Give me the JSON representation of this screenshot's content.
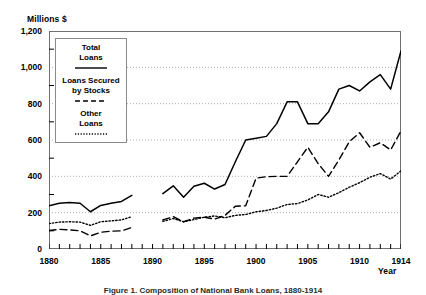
{
  "chart_data": {
    "type": "line",
    "title": "",
    "caption": "Figure 1. Composition of National Bank Loans, 1880-1914",
    "ylabel": "Millions $",
    "xlabel": "Year",
    "ylim": [
      0,
      1200
    ],
    "xlim": [
      1880,
      1914
    ],
    "yticks": [
      0,
      200,
      400,
      600,
      800,
      1000,
      1200
    ],
    "ytick_labels": [
      "0",
      "200",
      "400",
      "600",
      "800",
      "1,000",
      "1,200"
    ],
    "xticks": [
      1880,
      1885,
      1890,
      1895,
      1900,
      1905,
      1910,
      1914
    ],
    "xtick_labels": [
      "1880",
      "1885",
      "1890",
      "1895",
      "1900",
      "1905",
      "1910",
      "1914"
    ],
    "x_minor_tick_step": 1,
    "grid": "horizontal-dotted",
    "legend_position": "upper-left-inside",
    "series": [
      {
        "name": "Total Loans",
        "legend_label_lines": [
          "Total",
          "Loans"
        ],
        "style": "solid",
        "color": "#000000",
        "segments": [
          {
            "x": [
              1880,
              1881,
              1882,
              1883,
              1884,
              1885,
              1886,
              1887,
              1888
            ],
            "values": [
              238,
              252,
              256,
              252,
              205,
              240,
              252,
              262,
              295
            ]
          },
          {
            "x": [
              1891,
              1892,
              1893,
              1894,
              1895,
              1896,
              1897,
              1898,
              1899,
              1900,
              1901,
              1902,
              1903,
              1904,
              1905,
              1906,
              1907,
              1908,
              1909,
              1910,
              1911,
              1912,
              1913,
              1914
            ],
            "values": [
              305,
              348,
              285,
              345,
              362,
              330,
              355,
              480,
              600,
              610,
              620,
              690,
              810,
              810,
              690,
              690,
              755,
              880,
              900,
              870,
              920,
              960,
              880,
              1090
            ]
          }
        ]
      },
      {
        "name": "Loans Secured by Stocks",
        "legend_label_lines": [
          "Loans Secured",
          "by Stocks"
        ],
        "style": "dashed",
        "color": "#000000",
        "segments": [
          {
            "x": [
              1880,
              1881,
              1882,
              1883,
              1884,
              1885,
              1886,
              1887,
              1888
            ],
            "values": [
              102,
              108,
              105,
              100,
              72,
              92,
              98,
              100,
              118
            ]
          },
          {
            "x": [
              1891,
              1892,
              1893,
              1894,
              1895,
              1896,
              1897,
              1898,
              1899,
              1900,
              1901,
              1902,
              1903,
              1904,
              1905,
              1906,
              1907,
              1908,
              1909,
              1910,
              1911,
              1912,
              1913,
              1914
            ],
            "values": [
              160,
              178,
              150,
              170,
              175,
              165,
              185,
              235,
              238,
              390,
              398,
              400,
              400,
              480,
              560,
              470,
              400,
              490,
              590,
              640,
              560,
              585,
              545,
              650
            ]
          }
        ]
      },
      {
        "name": "Other Loans",
        "legend_label_lines": [
          "Other",
          "Loans"
        ],
        "style": "dotted",
        "color": "#000000",
        "segments": [
          {
            "x": [
              1880,
              1881,
              1882,
              1883,
              1884,
              1885,
              1886,
              1887,
              1888
            ],
            "values": [
              140,
              148,
              150,
              148,
              130,
              150,
              155,
              160,
              178
            ]
          },
          {
            "x": [
              1891,
              1892,
              1893,
              1894,
              1895,
              1896,
              1897,
              1898,
              1899,
              1900,
              1901,
              1902,
              1903,
              1904,
              1905,
              1906,
              1907,
              1908,
              1909,
              1910,
              1911,
              1912,
              1913,
              1914
            ],
            "values": [
              152,
              168,
              150,
              162,
              175,
              182,
              172,
              185,
              190,
              205,
              212,
              225,
              245,
              250,
              270,
              300,
              285,
              310,
              340,
              365,
              395,
              415,
              385,
              430
            ]
          }
        ]
      }
    ]
  }
}
